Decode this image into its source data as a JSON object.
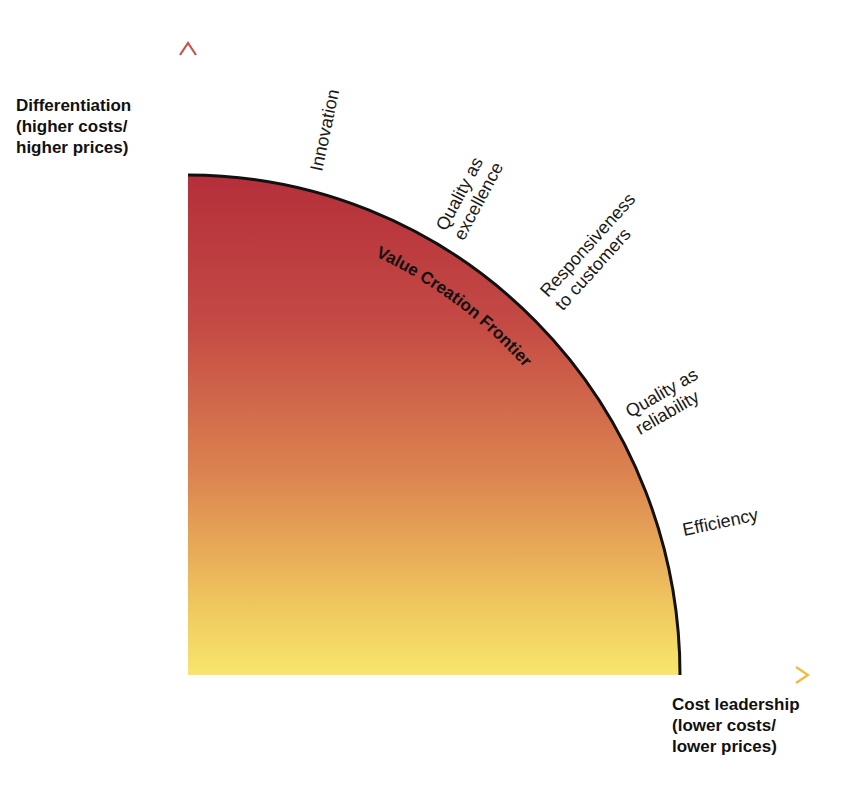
{
  "diagram": {
    "type": "value-creation-frontier",
    "y_axis": {
      "label_lines": [
        "Differentiation",
        "(higher costs/",
        "higher prices)"
      ],
      "arrow_color": "#c8524a"
    },
    "x_axis": {
      "label_lines": [
        "Cost leadership",
        "(lower costs/",
        "lower prices)"
      ],
      "arrow_color": "#f2b93b"
    },
    "frontier": {
      "label": "Value Creation Frontier",
      "gradient_top": "#b8323a",
      "gradient_mid": "#d9774a",
      "gradient_bottom": "#f5e36a",
      "stroke": "#111111"
    },
    "drivers": [
      {
        "id": "innovation",
        "lines": [
          "Innovation"
        ]
      },
      {
        "id": "quality-excellence",
        "lines": [
          "Quality as",
          "excellence"
        ]
      },
      {
        "id": "responsiveness",
        "lines": [
          "Responsiveness",
          "to customers"
        ]
      },
      {
        "id": "quality-reliability",
        "lines": [
          "Quality as",
          "reliability"
        ]
      },
      {
        "id": "efficiency",
        "lines": [
          "Efficiency"
        ]
      }
    ]
  }
}
